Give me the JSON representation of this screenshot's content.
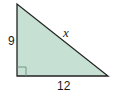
{
  "diagram": {
    "type": "right-triangle",
    "fill_color": "#c6e1d3",
    "stroke_color": "#222222",
    "vertices": {
      "top": [
        17,
        4
      ],
      "right_angle": [
        17,
        76
      ],
      "right": [
        108,
        76
      ]
    },
    "labels": {
      "vertical_leg": "9",
      "horizontal_leg": "12",
      "hypotenuse": "x"
    },
    "right_angle_marker": true
  }
}
